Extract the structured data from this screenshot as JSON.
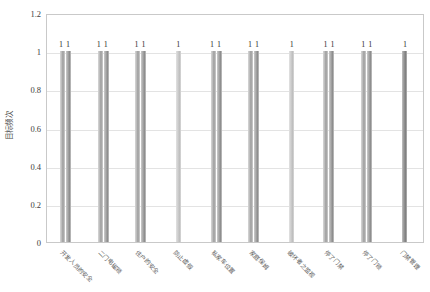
{
  "chart_data": {
    "type": "bar",
    "title": "",
    "xlabel": "",
    "ylabel": "目标频次",
    "ylim": [
      0,
      1.2
    ],
    "ytick_labels": [
      "1.2",
      "1",
      "0.8",
      "0.6",
      "0.4",
      "0.2",
      "0"
    ],
    "ytick_values": [
      1.2,
      1.0,
      0.8,
      0.6,
      0.4,
      0.2,
      0.0
    ],
    "grid": true,
    "legend": "none",
    "categories": [
      "开发人员的安全",
      "二门电磁锁",
      "住户的安全",
      "防止虚假",
      "私家车位置",
      "家庭保姆",
      "破坏者之监视",
      "停了门禁",
      "停了门锁",
      "门禁管理"
    ],
    "series": [
      {
        "name": "系列1",
        "values": [
          1,
          1,
          1,
          1,
          1,
          1,
          1,
          1,
          1,
          1
        ],
        "point_labels": [
          "1",
          "1",
          "1",
          "1",
          "1",
          "1",
          "1",
          "1",
          "1",
          "1"
        ]
      },
      {
        "name": "系列2",
        "values": [
          1,
          1,
          1,
          null,
          1,
          1,
          null,
          1,
          1,
          null
        ],
        "point_labels": [
          "1",
          "1",
          "1",
          "",
          "1",
          "1",
          "",
          "1",
          "1",
          ""
        ]
      }
    ],
    "group_label_text": [
      "11",
      "11",
      "11",
      "1",
      "11",
      "11",
      "1",
      "11",
      "11",
      "1"
    ],
    "colors": {
      "series_a": "#bdbdbd",
      "series_b": "#9a9a9a",
      "grid": "#e3e3e3",
      "frame": "#c9c9c9",
      "text": "#3b3b3b",
      "background": "#ffffff"
    }
  }
}
